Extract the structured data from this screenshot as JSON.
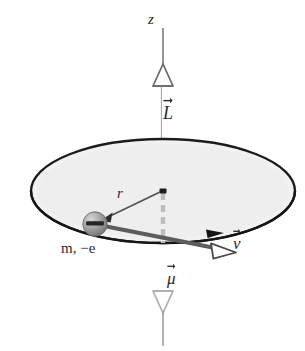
{
  "figure": {
    "labels": {
      "z_axis": "z",
      "angular_momentum": "L",
      "radius": "r",
      "particle": "m, −e",
      "particle_mass": "m",
      "particle_charge": "−e",
      "velocity": "v",
      "magnetic_moment": "μ"
    },
    "colors": {
      "axis_line": "#7a7a7a",
      "L_vector": "#4d4d4d",
      "mu_vector": "#b5b5b5",
      "disk_fill": "#f0f0f0",
      "disk_stroke": "#1a1a1a",
      "v_vector": "#5a5a5a",
      "r_vector": "#555555",
      "electron_body": "#8f8f8f",
      "electron_sign": "#2a2a2a",
      "text": "#2b2b2b",
      "background": "#ffffff"
    },
    "geometry": {
      "center_x": 163,
      "center_y": 191,
      "disk_rx": 132,
      "disk_ry": 52,
      "electron_x": 95,
      "electron_y": 224,
      "electron_r": 12,
      "z_top_y": 28,
      "mu_bottom_y": 346
    }
  }
}
